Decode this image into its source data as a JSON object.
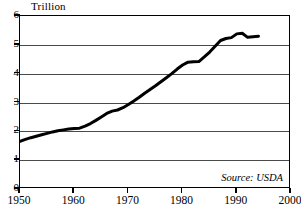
{
  "chart_data": {
    "type": "line",
    "title": "",
    "ylabel": "Trillion",
    "xlabel": "",
    "ylim": [
      0,
      6
    ],
    "xlim": [
      1950,
      2000
    ],
    "yticks": [
      0,
      1,
      2,
      3,
      4,
      5,
      6
    ],
    "xticks": [
      1950,
      1960,
      1970,
      1980,
      1990,
      2000
    ],
    "grid": true,
    "legend": "none",
    "annotations": [
      {
        "name": "source",
        "text": "Source: USDA",
        "position": "bottom-right",
        "style": "italic"
      }
    ],
    "series": [
      {
        "name": "value",
        "color": "#000000",
        "linewidth": 3,
        "x": [
          1950,
          1951,
          1952,
          1953,
          1954,
          1955,
          1956,
          1957,
          1958,
          1959,
          1960,
          1961,
          1962,
          1963,
          1964,
          1965,
          1966,
          1967,
          1968,
          1969,
          1970,
          1971,
          1972,
          1973,
          1974,
          1975,
          1976,
          1977,
          1978,
          1979,
          1980,
          1981,
          1982,
          1983,
          1984,
          1985,
          1986,
          1987,
          1988,
          1989,
          1990,
          1991,
          1992,
          1993,
          1994
        ],
        "values": [
          1.65,
          1.72,
          1.78,
          1.83,
          1.88,
          1.93,
          1.98,
          2.02,
          2.05,
          2.08,
          2.1,
          2.11,
          2.18,
          2.27,
          2.38,
          2.5,
          2.62,
          2.7,
          2.74,
          2.82,
          2.93,
          3.05,
          3.18,
          3.32,
          3.45,
          3.58,
          3.72,
          3.86,
          4.0,
          4.16,
          4.3,
          4.4,
          4.41,
          4.42,
          4.58,
          4.75,
          4.95,
          5.15,
          5.22,
          5.25,
          5.38,
          5.4,
          5.26,
          5.28,
          5.3
        ]
      }
    ]
  }
}
